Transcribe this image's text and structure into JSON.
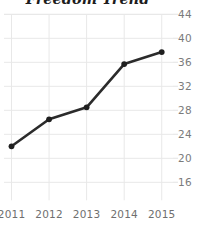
{
  "chart_data": {
    "type": "line",
    "title": "Freedom Trend",
    "xlabel": "",
    "ylabel": "",
    "categories": [
      "2011",
      "2012",
      "2013",
      "2014",
      "2015"
    ],
    "x": [
      2011,
      2012,
      2013,
      2014,
      2015
    ],
    "values": [
      22,
      26.5,
      28.5,
      35.7,
      37.7
    ],
    "series": [
      {
        "name": "Freedom Trend",
        "values": [
          22,
          26.5,
          28.5,
          35.7,
          37.7
        ]
      }
    ],
    "ylim": [
      14,
      44
    ],
    "xlim": [
      2010.8,
      2015.3
    ],
    "yticks": [
      44,
      40,
      36,
      32,
      28,
      24,
      20,
      16
    ],
    "ytick_labels": [
      "44",
      "40",
      "36",
      "32",
      "28",
      "24",
      "20",
      "16"
    ],
    "xticks": [
      2011,
      2012,
      2013,
      2014,
      2015
    ],
    "xtick_labels": [
      "2011",
      "2012",
      "2013",
      "2014",
      "2015"
    ],
    "grid": "horizontal-and-vertical",
    "legend": "none",
    "markers": "filled-circle",
    "colors": {
      "line": "#2b2b2b",
      "marker": "#1f1f1f",
      "grid": "#e8e8e8",
      "tick_label": "#7b7b7b",
      "title": "#1d1d1d",
      "background": "#ffffff"
    }
  }
}
